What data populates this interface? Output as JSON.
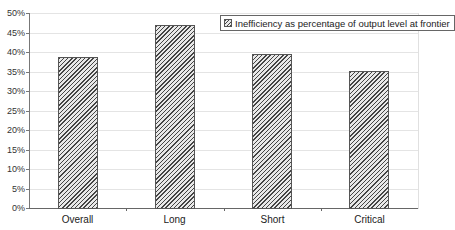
{
  "chart_data": {
    "type": "bar",
    "title": "",
    "xlabel": "",
    "ylabel": "",
    "categories": [
      "Overall",
      "Long",
      "Short",
      "Critical"
    ],
    "series": [
      {
        "name": "Inefficiency as percentage of output level at frontier",
        "values": [
          38.7,
          47.0,
          39.5,
          35.2
        ]
      }
    ],
    "ylim": [
      0,
      50
    ],
    "yticks": [
      "0%",
      "5%",
      "10%",
      "15%",
      "20%",
      "25%",
      "30%",
      "35%",
      "40%",
      "45%",
      "50%"
    ],
    "grid": true,
    "legend_position": "top-right",
    "bar_pattern": "diagonal-hatch"
  },
  "legend": {
    "label": "Inefficiency as percentage of output level at frontier"
  }
}
